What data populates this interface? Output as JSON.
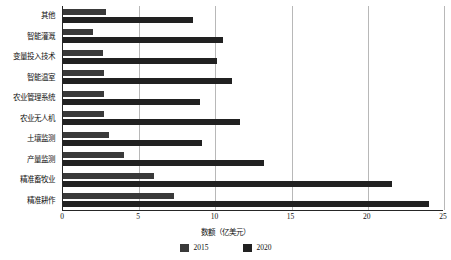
{
  "chart_data": {
    "type": "bar",
    "orientation": "horizontal",
    "title": "",
    "xlabel": "数额（亿美元）",
    "ylabel": "",
    "xlim": [
      0,
      25
    ],
    "ylim": null,
    "grid": true,
    "legend_position": "bottom",
    "xticks": [
      "0",
      "5",
      "10",
      "15",
      "20",
      "25"
    ],
    "xtick_values": [
      0,
      5,
      10,
      15,
      20,
      25
    ],
    "categories": [
      "其他",
      "智能灌溉",
      "变量投入技术",
      "智能温室",
      "农业管理系统",
      "农业无人机",
      "土壤监测",
      "产量监测",
      "精准畜牧业",
      "精准耕作"
    ],
    "series": [
      {
        "name": "2015",
        "color": "#3a3a3a",
        "values": [
          2.8,
          2.0,
          2.6,
          2.7,
          2.7,
          2.7,
          3.0,
          4.0,
          6.0,
          7.3
        ]
      },
      {
        "name": "2020",
        "color": "#212121",
        "values": [
          8.5,
          10.5,
          10.1,
          11.1,
          9.0,
          11.6,
          9.1,
          13.2,
          21.6,
          24.0
        ]
      }
    ]
  },
  "legend": {
    "items": [
      {
        "label": "2015",
        "color": "#3a3a3a",
        "icon": "legend-swatch-icon"
      },
      {
        "label": "2020",
        "color": "#212121",
        "icon": "legend-swatch-icon"
      }
    ]
  },
  "axis": {
    "x_title": "数额（亿美元）"
  }
}
